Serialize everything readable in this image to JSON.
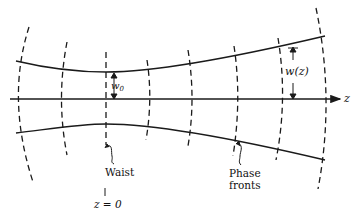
{
  "diagram": {
    "type": "gaussian-beam-profile",
    "axis_label": "z",
    "waist_radius_label": "w",
    "waist_radius_subscript": "0",
    "beam_radius_label": "w(z)",
    "waist_label": "Waist",
    "phase_fronts_label_line1": "Phase",
    "phase_fronts_label_line2": "fronts",
    "origin_label": "z = 0",
    "colors": {
      "line": "#1a1a1a",
      "background": "#ffffff"
    }
  }
}
